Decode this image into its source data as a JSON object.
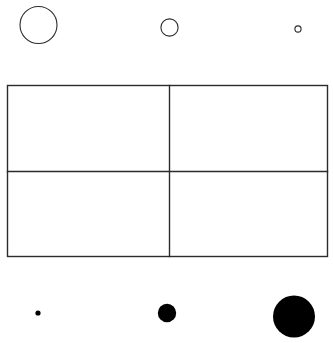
{
  "figure": {
    "canvas": {
      "width": 333,
      "height": 343,
      "background_color": "#ffffff"
    },
    "stroke_color": "#2b2b2b",
    "fill_color": "#000000",
    "top_row": {
      "label": "Outlined circles, decreasing size left to right",
      "shape_type": "circle-outline",
      "items": [
        {
          "name": "large-outline-circle",
          "cx": 38.5,
          "cy": 25,
          "r": 18.5,
          "stroke_width": 1.1
        },
        {
          "name": "medium-outline-circle",
          "cx": 169.5,
          "cy": 27.5,
          "r": 8.6,
          "stroke_width": 1.1
        },
        {
          "name": "small-outline-circle",
          "cx": 298,
          "cy": 29,
          "r": 3.1,
          "stroke_width": 1.1
        }
      ]
    },
    "grid": {
      "label": "Two by two rectangular grid",
      "left": 7.5,
      "top": 85.5,
      "right": 327.5,
      "bottom": 256.5,
      "vertical_divider_x": 169.5,
      "horizontal_divider_y": 171.5,
      "rows": 2,
      "columns": 2,
      "stroke_width": 1.4,
      "cells": [
        {
          "name": "grid-cell-top-left",
          "row": 1,
          "column": 1,
          "content": ""
        },
        {
          "name": "grid-cell-top-right",
          "row": 1,
          "column": 2,
          "content": ""
        },
        {
          "name": "grid-cell-bottom-left",
          "row": 2,
          "column": 1,
          "content": ""
        },
        {
          "name": "grid-cell-bottom-right",
          "row": 2,
          "column": 2,
          "content": ""
        }
      ]
    },
    "bottom_row": {
      "label": "Filled dots, increasing size left to right",
      "shape_type": "circle-filled",
      "items": [
        {
          "name": "small-filled-dot",
          "cx": 38,
          "cy": 313,
          "r": 2.6
        },
        {
          "name": "medium-filled-dot",
          "cx": 167,
          "cy": 313,
          "r": 9.2
        },
        {
          "name": "large-filled-dot",
          "cx": 294,
          "cy": 316.5,
          "r": 21
        }
      ]
    }
  }
}
